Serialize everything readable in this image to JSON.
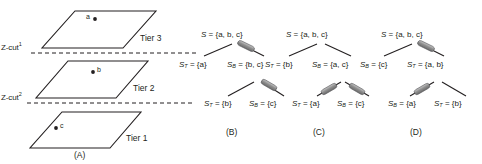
{
  "figure": {
    "panels": [
      {
        "id": "A",
        "caption": "(A)",
        "tiers": [
          {
            "label": "Tier 3",
            "point": "a"
          },
          {
            "label": "Tier 2",
            "point": "b"
          },
          {
            "label": "Tier 1",
            "point": "c"
          }
        ],
        "cuts": [
          {
            "label": "Z-cut",
            "sup": "1"
          },
          {
            "label": "Z-cut",
            "sup": "2"
          }
        ]
      },
      {
        "id": "B",
        "caption": "(B)",
        "nodes": {
          "root": {
            "sym": "S",
            "sub": "",
            "value": "= {a, b, c}"
          },
          "l1_left": {
            "sym": "S",
            "sub": "T",
            "value": "= {a}"
          },
          "l1_right": {
            "sym": "S",
            "sub": "B",
            "value": "= {b, c}"
          },
          "l2_left": {
            "sym": "S",
            "sub": "T",
            "value": "= {b}"
          },
          "l2_right": {
            "sym": "S",
            "sub": "B",
            "value": "= {c}"
          }
        }
      },
      {
        "id": "C",
        "caption": "(C)",
        "nodes": {
          "root": {
            "sym": "S",
            "sub": "",
            "value": "= {a, b, c}"
          },
          "l1_left": {
            "sym": "S",
            "sub": "T",
            "value": "= {b}"
          },
          "l1_right": {
            "sym": "S",
            "sub": "B",
            "value": "= {a, c}"
          },
          "l2_left": {
            "sym": "S",
            "sub": "T",
            "value": "= {a}"
          },
          "l2_right": {
            "sym": "S",
            "sub": "B",
            "value": "= {c}"
          }
        }
      },
      {
        "id": "D",
        "caption": "(D)",
        "nodes": {
          "root": {
            "sym": "S",
            "sub": "",
            "value": "= {a, b, c}"
          },
          "l1_left": {
            "sym": "S",
            "sub": "B",
            "value": "= {c}"
          },
          "l1_right": {
            "sym": "S",
            "sub": "T",
            "value": "= {a, b}"
          },
          "l2_left": {
            "sym": "S",
            "sub": "B",
            "value": "= {a}"
          },
          "l2_right": {
            "sym": "S",
            "sub": "T",
            "value": "= {b}"
          }
        }
      }
    ],
    "colors": {
      "ink": "#231f20",
      "marker_fill": "#9a9a9a",
      "marker_stroke": "#58595b"
    }
  }
}
